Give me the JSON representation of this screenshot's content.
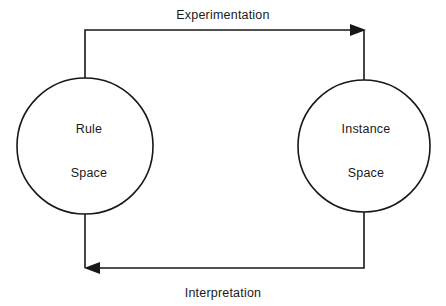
{
  "diagram": {
    "background_color": "#ffffff",
    "line_color": "#171717",
    "text_color": "#1a1a1a",
    "nodes": [
      {
        "id": "rule-space",
        "line1": "Rule",
        "line2": "Space",
        "shape": "circle",
        "cx": 85,
        "cy": 146,
        "r": 68
      },
      {
        "id": "instance-space",
        "line1": "Instance",
        "line2": "Space",
        "shape": "circle",
        "cx": 364,
        "cy": 146,
        "r": 66
      }
    ],
    "edges": [
      {
        "id": "experimentation",
        "label": "Experimentation",
        "from": "rule-space",
        "to": "instance-space",
        "direction": "right",
        "arrowhead": "right"
      },
      {
        "id": "interpretation",
        "label": "Interpretation",
        "from": "instance-space",
        "to": "rule-space",
        "direction": "left",
        "arrowhead": "left"
      }
    ]
  }
}
